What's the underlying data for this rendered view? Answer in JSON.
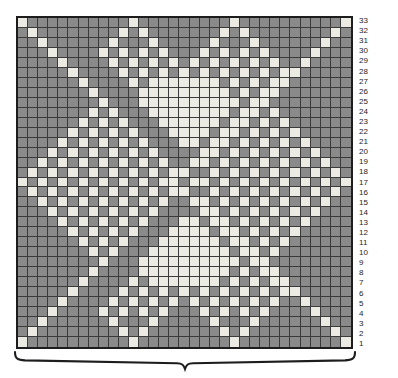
{
  "figure": {
    "type": "knitting-colorwork-chart",
    "title": "",
    "width_stitches": 33,
    "height_rows": 33
  },
  "chart_data": {
    "type": "heatmap",
    "title": "",
    "subtitle": "",
    "xlabel": "",
    "ylabel": "",
    "grid": true,
    "legend_position": "none",
    "colors": {
      "background_stitch": "#8a8a8a",
      "contrast_stitch": "#ebebe4",
      "grid_line": "#3a3a3a",
      "border": "#1d1d1d",
      "row_number_text": "#1d1d1d",
      "brace": "#1d1d1d"
    },
    "value_labels": {
      "0": "background-stitch",
      "1": "contrast-stitch"
    },
    "columns": 33,
    "rows": 33,
    "row_numbers": [
      33,
      32,
      31,
      30,
      29,
      28,
      27,
      26,
      25,
      24,
      23,
      22,
      21,
      20,
      19,
      18,
      17,
      16,
      15,
      14,
      13,
      12,
      11,
      10,
      9,
      8,
      7,
      6,
      5,
      4,
      3,
      2,
      1
    ],
    "row_numbers_side": "right",
    "row_numbering_direction": "bottom-to-top",
    "cells": [
      [
        1,
        0,
        0,
        0,
        0,
        0,
        0,
        0,
        0,
        0,
        0,
        1,
        0,
        0,
        0,
        0,
        0,
        0,
        0,
        0,
        0,
        1,
        0,
        0,
        0,
        0,
        0,
        0,
        0,
        0,
        0,
        0,
        1
      ],
      [
        0,
        1,
        0,
        0,
        0,
        0,
        0,
        0,
        0,
        0,
        1,
        0,
        1,
        0,
        0,
        0,
        0,
        0,
        0,
        0,
        1,
        0,
        1,
        0,
        0,
        0,
        0,
        0,
        0,
        0,
        0,
        1,
        0
      ],
      [
        0,
        0,
        1,
        0,
        0,
        0,
        0,
        0,
        0,
        1,
        0,
        0,
        0,
        1,
        0,
        0,
        0,
        0,
        0,
        1,
        0,
        0,
        0,
        1,
        0,
        0,
        0,
        0,
        0,
        0,
        1,
        0,
        0
      ],
      [
        0,
        0,
        0,
        1,
        0,
        0,
        0,
        0,
        1,
        0,
        1,
        0,
        1,
        0,
        1,
        0,
        0,
        0,
        1,
        0,
        1,
        0,
        1,
        0,
        1,
        0,
        0,
        0,
        0,
        1,
        0,
        0,
        0
      ],
      [
        0,
        0,
        0,
        0,
        1,
        0,
        0,
        0,
        0,
        1,
        0,
        1,
        0,
        1,
        0,
        1,
        0,
        1,
        0,
        1,
        0,
        1,
        0,
        1,
        0,
        1,
        0,
        0,
        1,
        0,
        0,
        0,
        0
      ],
      [
        0,
        0,
        0,
        0,
        0,
        1,
        0,
        0,
        0,
        0,
        1,
        0,
        1,
        0,
        1,
        0,
        1,
        0,
        1,
        0,
        1,
        0,
        1,
        0,
        1,
        0,
        1,
        1,
        0,
        0,
        0,
        0,
        0
      ],
      [
        0,
        0,
        0,
        0,
        0,
        0,
        1,
        0,
        0,
        0,
        0,
        1,
        0,
        1,
        1,
        1,
        1,
        1,
        1,
        1,
        0,
        1,
        0,
        1,
        0,
        1,
        1,
        0,
        0,
        0,
        0,
        0,
        0
      ],
      [
        0,
        0,
        0,
        0,
        0,
        0,
        0,
        1,
        0,
        0,
        0,
        0,
        1,
        1,
        1,
        1,
        1,
        1,
        1,
        1,
        1,
        0,
        1,
        0,
        1,
        1,
        0,
        0,
        0,
        0,
        0,
        0,
        0
      ],
      [
        0,
        0,
        0,
        0,
        0,
        0,
        0,
        0,
        1,
        0,
        0,
        0,
        1,
        1,
        1,
        1,
        1,
        1,
        1,
        1,
        1,
        1,
        0,
        1,
        1,
        0,
        0,
        0,
        0,
        0,
        0,
        0,
        0
      ],
      [
        0,
        0,
        0,
        0,
        0,
        0,
        0,
        1,
        0,
        1,
        0,
        0,
        0,
        1,
        1,
        1,
        1,
        1,
        1,
        1,
        1,
        0,
        1,
        1,
        0,
        1,
        0,
        0,
        0,
        0,
        0,
        0,
        0
      ],
      [
        0,
        0,
        0,
        0,
        0,
        0,
        1,
        0,
        1,
        0,
        1,
        0,
        0,
        0,
        1,
        1,
        1,
        1,
        1,
        1,
        0,
        1,
        1,
        0,
        1,
        0,
        1,
        0,
        0,
        0,
        0,
        0,
        0
      ],
      [
        0,
        0,
        0,
        0,
        0,
        1,
        0,
        1,
        0,
        1,
        0,
        1,
        0,
        0,
        0,
        1,
        1,
        1,
        1,
        0,
        1,
        1,
        0,
        1,
        0,
        1,
        0,
        1,
        0,
        0,
        0,
        0,
        0
      ],
      [
        0,
        0,
        0,
        0,
        1,
        0,
        1,
        0,
        1,
        0,
        1,
        0,
        1,
        0,
        0,
        0,
        1,
        1,
        0,
        1,
        1,
        0,
        1,
        0,
        1,
        0,
        1,
        0,
        1,
        0,
        0,
        0,
        0
      ],
      [
        0,
        0,
        0,
        1,
        0,
        1,
        0,
        1,
        0,
        1,
        0,
        1,
        0,
        1,
        0,
        0,
        0,
        0,
        1,
        1,
        0,
        1,
        0,
        1,
        0,
        1,
        0,
        1,
        0,
        1,
        0,
        0,
        0
      ],
      [
        0,
        0,
        1,
        0,
        1,
        0,
        1,
        0,
        1,
        0,
        1,
        0,
        1,
        0,
        1,
        0,
        0,
        1,
        1,
        0,
        1,
        0,
        1,
        0,
        1,
        0,
        1,
        0,
        1,
        0,
        1,
        0,
        0
      ],
      [
        0,
        1,
        0,
        1,
        0,
        1,
        0,
        1,
        0,
        1,
        0,
        1,
        0,
        1,
        0,
        1,
        1,
        0,
        0,
        1,
        0,
        1,
        0,
        1,
        0,
        1,
        0,
        1,
        0,
        1,
        0,
        1,
        0
      ],
      [
        1,
        0,
        1,
        0,
        1,
        0,
        1,
        0,
        1,
        0,
        1,
        0,
        1,
        0,
        1,
        1,
        0,
        1,
        1,
        0,
        1,
        0,
        1,
        0,
        1,
        0,
        1,
        0,
        1,
        0,
        1,
        0,
        1
      ],
      [
        0,
        1,
        0,
        1,
        0,
        1,
        0,
        1,
        0,
        1,
        0,
        1,
        0,
        1,
        0,
        1,
        1,
        0,
        0,
        1,
        0,
        1,
        0,
        1,
        0,
        1,
        0,
        1,
        0,
        1,
        0,
        1,
        0
      ],
      [
        0,
        0,
        1,
        0,
        1,
        0,
        1,
        0,
        1,
        0,
        1,
        0,
        1,
        0,
        1,
        0,
        0,
        1,
        1,
        0,
        1,
        0,
        1,
        0,
        1,
        0,
        1,
        0,
        1,
        0,
        1,
        0,
        0
      ],
      [
        0,
        0,
        0,
        1,
        0,
        1,
        0,
        1,
        0,
        1,
        0,
        1,
        0,
        1,
        0,
        0,
        0,
        0,
        1,
        1,
        0,
        1,
        0,
        1,
        0,
        1,
        0,
        1,
        0,
        1,
        0,
        0,
        0
      ],
      [
        0,
        0,
        0,
        0,
        1,
        0,
        1,
        0,
        1,
        0,
        1,
        0,
        1,
        0,
        0,
        0,
        1,
        1,
        0,
        1,
        1,
        0,
        1,
        0,
        1,
        0,
        1,
        0,
        1,
        0,
        0,
        0,
        0
      ],
      [
        0,
        0,
        0,
        0,
        0,
        1,
        0,
        1,
        0,
        1,
        0,
        1,
        0,
        0,
        0,
        1,
        1,
        1,
        1,
        0,
        1,
        1,
        0,
        1,
        0,
        1,
        0,
        1,
        0,
        0,
        0,
        0,
        0
      ],
      [
        0,
        0,
        0,
        0,
        0,
        0,
        1,
        0,
        1,
        0,
        1,
        0,
        0,
        0,
        1,
        1,
        1,
        1,
        1,
        1,
        0,
        1,
        1,
        0,
        1,
        0,
        1,
        0,
        0,
        0,
        0,
        0,
        0
      ],
      [
        0,
        0,
        0,
        0,
        0,
        0,
        0,
        1,
        0,
        1,
        0,
        0,
        0,
        1,
        1,
        1,
        1,
        1,
        1,
        1,
        1,
        0,
        1,
        1,
        0,
        1,
        0,
        0,
        0,
        0,
        0,
        0,
        0
      ],
      [
        0,
        0,
        0,
        0,
        0,
        0,
        0,
        0,
        1,
        0,
        0,
        0,
        1,
        1,
        1,
        1,
        1,
        1,
        1,
        1,
        1,
        1,
        0,
        1,
        1,
        0,
        0,
        0,
        0,
        0,
        0,
        0,
        0
      ],
      [
        0,
        0,
        0,
        0,
        0,
        0,
        0,
        1,
        0,
        0,
        0,
        0,
        1,
        1,
        1,
        1,
        1,
        1,
        1,
        1,
        1,
        0,
        1,
        0,
        1,
        1,
        0,
        0,
        0,
        0,
        0,
        0,
        0
      ],
      [
        0,
        0,
        0,
        0,
        0,
        0,
        1,
        0,
        0,
        0,
        0,
        1,
        0,
        1,
        1,
        1,
        1,
        1,
        1,
        1,
        0,
        1,
        0,
        1,
        0,
        1,
        1,
        0,
        0,
        0,
        0,
        0,
        0
      ],
      [
        0,
        0,
        0,
        0,
        0,
        1,
        0,
        0,
        0,
        0,
        1,
        0,
        1,
        0,
        1,
        0,
        1,
        0,
        1,
        0,
        1,
        0,
        1,
        0,
        1,
        0,
        1,
        1,
        0,
        0,
        0,
        0,
        0
      ],
      [
        0,
        0,
        0,
        0,
        1,
        0,
        0,
        0,
        0,
        1,
        0,
        1,
        0,
        1,
        0,
        1,
        0,
        1,
        0,
        1,
        0,
        1,
        0,
        1,
        0,
        1,
        0,
        0,
        1,
        0,
        0,
        0,
        0
      ],
      [
        0,
        0,
        0,
        1,
        0,
        0,
        0,
        0,
        1,
        0,
        1,
        0,
        1,
        0,
        1,
        0,
        0,
        0,
        1,
        0,
        1,
        0,
        1,
        0,
        1,
        0,
        0,
        0,
        0,
        1,
        0,
        0,
        0
      ],
      [
        0,
        0,
        1,
        0,
        0,
        0,
        0,
        0,
        0,
        1,
        0,
        0,
        0,
        1,
        0,
        0,
        0,
        0,
        0,
        1,
        0,
        0,
        0,
        1,
        0,
        0,
        0,
        0,
        0,
        0,
        1,
        0,
        0
      ],
      [
        0,
        1,
        0,
        0,
        0,
        0,
        0,
        0,
        0,
        0,
        1,
        0,
        1,
        0,
        0,
        0,
        0,
        0,
        0,
        0,
        1,
        0,
        1,
        0,
        0,
        0,
        0,
        0,
        0,
        0,
        0,
        1,
        0
      ],
      [
        1,
        0,
        0,
        0,
        0,
        0,
        0,
        0,
        0,
        0,
        0,
        1,
        0,
        0,
        0,
        0,
        0,
        0,
        0,
        0,
        0,
        1,
        0,
        0,
        0,
        0,
        0,
        0,
        0,
        0,
        0,
        0,
        1
      ]
    ]
  },
  "repeat_brace": {
    "label": "",
    "spans_stitches": 33,
    "position": "below-chart",
    "direction": "down"
  }
}
